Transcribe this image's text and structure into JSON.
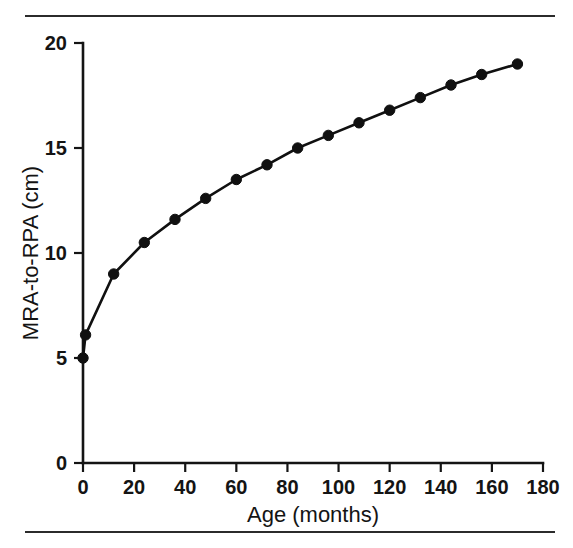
{
  "figure": {
    "rule_top_label": "top-divider-rule",
    "rule_bottom_label": "bottom-divider-rule"
  },
  "chart_data": {
    "type": "line",
    "title": "",
    "subtitle": "",
    "xlabel": "Age (months)",
    "ylabel": "MRA-to-RPA (cm)",
    "xlim": [
      0,
      180
    ],
    "ylim": [
      0,
      20
    ],
    "xticks": [
      0,
      20,
      40,
      60,
      80,
      100,
      120,
      140,
      160,
      180
    ],
    "xticklabels": [
      "0",
      "20",
      "40",
      "60",
      "80",
      "100",
      "120",
      "140",
      "160",
      "180"
    ],
    "yticks": [
      0,
      5,
      10,
      15,
      20
    ],
    "yticklabels": [
      "0",
      "5",
      "10",
      "15",
      "20"
    ],
    "grid": false,
    "legend": false,
    "legend_position": "none",
    "marker": "filled-circle",
    "line_color": "#101010",
    "marker_color": "#101010",
    "x": [
      0,
      1,
      12,
      24,
      36,
      48,
      60,
      72,
      84,
      96,
      108,
      120,
      132,
      144,
      156,
      170
    ],
    "y": [
      5.0,
      6.1,
      9.0,
      10.5,
      11.6,
      12.6,
      13.5,
      14.2,
      15.0,
      15.6,
      16.2,
      16.8,
      17.4,
      18.0,
      18.5,
      19.0
    ],
    "series": [
      {
        "name": "MRA-to-RPA distance",
        "x": [
          0,
          1,
          12,
          24,
          36,
          48,
          60,
          72,
          84,
          96,
          108,
          120,
          132,
          144,
          156,
          170
        ],
        "values": [
          5.0,
          6.1,
          9.0,
          10.5,
          11.6,
          12.6,
          13.5,
          14.2,
          15.0,
          15.6,
          16.2,
          16.8,
          17.4,
          18.0,
          18.5,
          19.0
        ]
      }
    ]
  }
}
